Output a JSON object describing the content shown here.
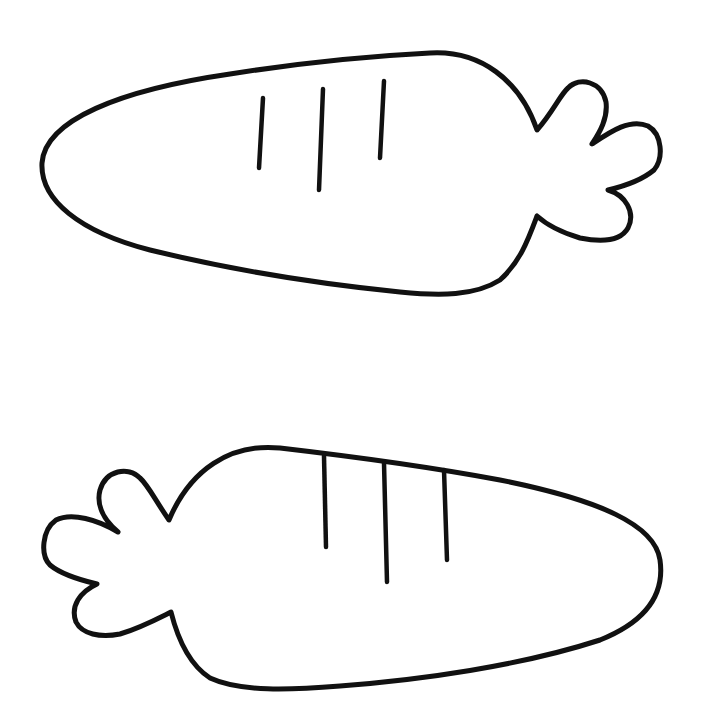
{
  "figure": {
    "colors": {
      "background": "#ffffff",
      "line": "#111111"
    },
    "carrots": [
      {
        "label": "carrot-top",
        "orientation": "tip-left",
        "stripes": 3,
        "leaves": 3
      },
      {
        "label": "carrot-bottom",
        "orientation": "tip-right",
        "stripes": 3,
        "leaves": 3
      }
    ]
  }
}
